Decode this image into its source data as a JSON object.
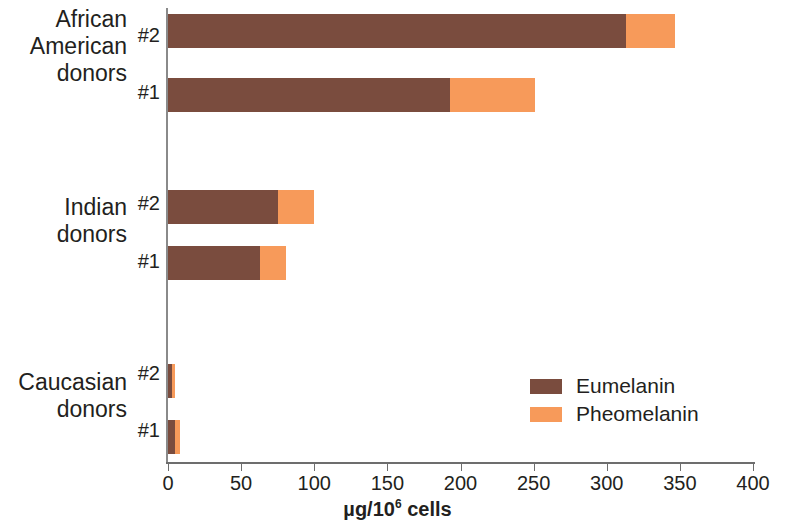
{
  "chart_data": {
    "type": "bar",
    "orientation": "horizontal",
    "stacked": true,
    "title": "",
    "xlabel": "µg/10⁶ cells",
    "ylabel": "",
    "xlim": [
      0,
      400
    ],
    "xticks": [
      0,
      50,
      100,
      150,
      200,
      250,
      300,
      350,
      400
    ],
    "xtick_labels": [
      "0",
      "50",
      "100",
      "150",
      "200",
      "250",
      "300",
      "350",
      "400"
    ],
    "grid": false,
    "legend_position": "inside-right",
    "groups": [
      {
        "name": "African American donors",
        "label_lines": [
          "African",
          "American",
          "donors"
        ]
      },
      {
        "name": "Indian donors",
        "label_lines": [
          "Indian",
          "donors"
        ]
      },
      {
        "name": "Caucasian donors",
        "label_lines": [
          "Caucasian",
          "donors"
        ]
      }
    ],
    "categories": [
      "African American donors #2",
      "African American donors #1",
      "Indian donors #2",
      "Indian donors #1",
      "Caucasian donors #2",
      "Caucasian donors #1"
    ],
    "donor_labels": [
      "#2",
      "#1",
      "#2",
      "#1",
      "#2",
      "#1"
    ],
    "series": [
      {
        "name": "Eumelanin",
        "color": "#7a4c3e",
        "values": [
          313,
          193,
          75,
          63,
          3,
          5
        ]
      },
      {
        "name": "Pheomelanin",
        "color": "#f79a5a",
        "values": [
          34,
          58,
          25,
          18,
          2,
          3
        ]
      }
    ],
    "totals": [
      347,
      251,
      100,
      81,
      5,
      8
    ]
  },
  "axis": {
    "tick_labels": [
      "0",
      "50",
      "100",
      "150",
      "200",
      "250",
      "300",
      "350",
      "400"
    ],
    "x_title_main": "µg/10",
    "x_title_sup": "6",
    "x_title_tail": " cells"
  },
  "legend": {
    "items": [
      {
        "label": "Eumelanin",
        "color": "#7a4c3e"
      },
      {
        "label": "Pheomelanin",
        "color": "#f79a5a"
      }
    ]
  },
  "y_labels": {
    "groups": [
      {
        "lines": [
          "African",
          "American",
          "donors"
        ]
      },
      {
        "lines": [
          "Indian",
          "donors"
        ]
      },
      {
        "lines": [
          "Caucasian",
          "donors"
        ]
      }
    ],
    "donors": [
      "#2",
      "#1",
      "#2",
      "#1",
      "#2",
      "#1"
    ]
  }
}
